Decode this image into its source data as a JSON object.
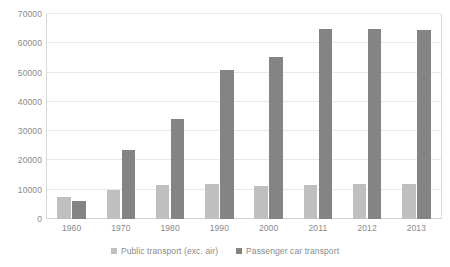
{
  "chart_data": {
    "type": "bar",
    "title": "",
    "subtitle": "",
    "xlabel": "",
    "ylabel": "",
    "categories": [
      "1960",
      "1970",
      "1980",
      "1990",
      "2000",
      "2011",
      "2012",
      "2013"
    ],
    "series": [
      {
        "name": "Public transport (exc. air)",
        "color": "#bfbfbf",
        "values": [
          7600,
          9800,
          11500,
          11900,
          11300,
          11700,
          12000,
          11800
        ]
      },
      {
        "name": "Passenger car transport",
        "color": "#848484",
        "values": [
          6200,
          23500,
          34200,
          51000,
          55200,
          65000,
          64800,
          64500
        ]
      }
    ],
    "ylim": [
      0,
      70000
    ],
    "ytick_values": [
      0,
      10000,
      20000,
      30000,
      40000,
      50000,
      60000,
      70000
    ],
    "ytick_labels": [
      "0",
      "10000",
      "20000",
      "30000",
      "40000",
      "50000",
      "60000",
      "70000"
    ],
    "grid": true,
    "legend_position": "bottom"
  },
  "colors": {
    "gridline": "#e8e8e8",
    "axis": "#d9d9d9",
    "text": "#8a8a8a",
    "background": "#ffffff"
  }
}
